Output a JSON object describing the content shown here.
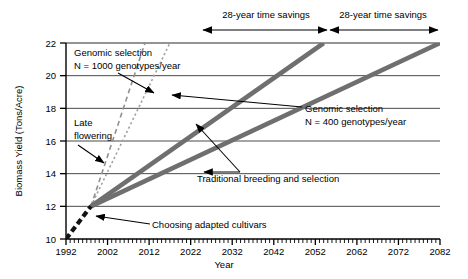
{
  "chart_data": {
    "type": "line",
    "title": "",
    "xlabel": "Year",
    "ylabel": "Biomass Yield (Tons/Acre)",
    "xlim": [
      1992,
      2082
    ],
    "ylim": [
      10,
      22
    ],
    "xticks": [
      1992,
      2002,
      2012,
      2022,
      2032,
      2042,
      2052,
      2062,
      2072,
      2082
    ],
    "yticks": [
      10,
      12,
      14,
      16,
      18,
      20,
      22
    ],
    "x_minor_tick_interval": 1,
    "grid": "horizontal",
    "legend": "none (inline annotations)",
    "series": [
      {
        "name": "Choosing adapted cultivars",
        "style": "thick black dashed",
        "points": [
          [
            1992,
            10
          ],
          [
            1998,
            12
          ]
        ]
      },
      {
        "name": "Traditional breeding and selection",
        "style": "thick gray solid",
        "points": [
          [
            1998,
            12
          ],
          [
            2082,
            22
          ]
        ]
      },
      {
        "name": "Genomic selection N = 400 genotypes/year",
        "style": "thick gray solid",
        "points": [
          [
            1998,
            12
          ],
          [
            2054,
            22
          ]
        ]
      },
      {
        "name": "Late flowering",
        "style": "thin gray dashed",
        "points": [
          [
            1998,
            12
          ],
          [
            2011,
            22
          ]
        ]
      },
      {
        "name": "Genomic selection N = 1000 genotypes/year",
        "style": "thin gray dotted",
        "points": [
          [
            1998,
            12
          ],
          [
            2017,
            22
          ]
        ]
      }
    ],
    "annotations": [
      {
        "id": "genomic-1000",
        "text_lines": [
          "Genomic selection",
          "N = 1000 genotypes/year"
        ],
        "points_to": [
          2012,
          19.2
        ]
      },
      {
        "id": "late-flowering",
        "text_lines": [
          "Late",
          "flowering"
        ],
        "points_to": [
          2006,
          14.6
        ]
      },
      {
        "id": "traditional",
        "text_lines": [
          "Traditional breeding and selection"
        ],
        "points_to": [
          2031,
          14.0
        ]
      },
      {
        "id": "genomic-400",
        "text_lines": [
          "Genomic selection",
          "N = 400 genotypes/year"
        ],
        "points_to": [
          2024,
          17.6
        ]
      },
      {
        "id": "choosing-cultivars",
        "text_lines": [
          "Choosing adapted cultivars"
        ],
        "points_to": [
          1996,
          11.3
        ]
      },
      {
        "id": "time-savings-left",
        "text_lines": [
          "28-year time savings"
        ],
        "span": [
          2017,
          2054
        ]
      },
      {
        "id": "time-savings-right",
        "text_lines": [
          "28-year time savings"
        ],
        "span": [
          2054,
          2082
        ]
      }
    ],
    "colors": {
      "axis": "#000000",
      "grid": "#3a3a3a",
      "thick_line": "#6e6e6e",
      "thin_line": "#8a8a8a",
      "dashed_black": "#111111",
      "background": "#ffffff"
    }
  },
  "axes": {
    "y_label": "Biomass Yield (Tons/Acre)",
    "x_label": "Year",
    "y_ticks": [
      "22",
      "20",
      "18",
      "16",
      "14",
      "12",
      "10"
    ],
    "x_ticks": [
      "1992",
      "2002",
      "2012",
      "2022",
      "2032",
      "2042",
      "2052",
      "2062",
      "2072",
      "2082"
    ]
  },
  "annotations": {
    "genomic_1000_line1": "Genomic selection",
    "genomic_1000_line2": "N = 1000 genotypes/year",
    "late_flowering_line1": "Late",
    "late_flowering_line2": "flowering",
    "traditional": "Traditional breeding and selection",
    "genomic_400_line1": "Genomic selection",
    "genomic_400_line2": "N = 400 genotypes/year",
    "choosing_cultivars": "Choosing adapted cultivars",
    "time_savings_left": "28-year time savings",
    "time_savings_right": "28-year time savings"
  }
}
